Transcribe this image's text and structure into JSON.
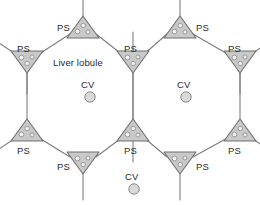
{
  "figure": {
    "background_color": "#ffffff",
    "line_color": "#7a7a7a",
    "triad_fill": "#c9c9c9",
    "triad_stroke": "#6f6f6f",
    "vein_fill": "#d9d9d9",
    "vein_stroke": "#8a8a8a",
    "text_color": "#2b2b2b"
  },
  "labels": {
    "lobule": "Liver lobule",
    "portal_space": "PS",
    "central_vein": "CV"
  },
  "legend_terms": [
    {
      "abbr": "PS",
      "meaning": "Portal space (portal triad)"
    },
    {
      "abbr": "CV",
      "meaning": "Central vein"
    }
  ],
  "portal_spaces": [
    {
      "id": "ps-top-left",
      "label": "PS",
      "x": 83,
      "y": 27,
      "orientation": "up",
      "label_x": 57,
      "label_y": 23
    },
    {
      "id": "ps-top-right",
      "label": "PS",
      "x": 180,
      "y": 27,
      "orientation": "up",
      "label_x": 196,
      "label_y": 23
    },
    {
      "id": "ps-upper-left",
      "label": "PS",
      "x": 27,
      "y": 62,
      "orientation": "down",
      "label_x": 17,
      "label_y": 44
    },
    {
      "id": "ps-upper-middle",
      "label": "PS",
      "x": 133,
      "y": 62,
      "orientation": "down",
      "label_x": 124,
      "label_y": 44
    },
    {
      "id": "ps-upper-right",
      "label": "PS",
      "x": 240,
      "y": 62,
      "orientation": "down",
      "label_x": 228,
      "label_y": 44
    },
    {
      "id": "ps-lower-left",
      "label": "PS",
      "x": 27,
      "y": 130,
      "orientation": "up",
      "label_x": 17,
      "label_y": 146
    },
    {
      "id": "ps-lower-middle",
      "label": "PS",
      "x": 133,
      "y": 130,
      "orientation": "up",
      "label_x": 124,
      "label_y": 146
    },
    {
      "id": "ps-lower-right",
      "label": "PS",
      "x": 240,
      "y": 130,
      "orientation": "up",
      "label_x": 228,
      "label_y": 146
    },
    {
      "id": "ps-bottom-left",
      "label": "PS",
      "x": 83,
      "y": 163,
      "orientation": "down",
      "label_x": 57,
      "label_y": 162
    },
    {
      "id": "ps-bottom-right",
      "label": "PS",
      "x": 180,
      "y": 163,
      "orientation": "down",
      "label_x": 196,
      "label_y": 162
    }
  ],
  "central_veins": [
    {
      "id": "cv-left",
      "label": "CV",
      "x": 90,
      "y": 97,
      "label_x": 81,
      "label_y": 80
    },
    {
      "id": "cv-right",
      "label": "CV",
      "x": 186,
      "y": 97,
      "label_x": 177,
      "label_y": 80
    },
    {
      "id": "cv-bottom",
      "label": "CV",
      "x": 134,
      "y": 189,
      "label_x": 125,
      "label_y": 172
    }
  ],
  "lobule_annotation": {
    "text": "Liver lobule",
    "x": 53,
    "y": 58
  }
}
